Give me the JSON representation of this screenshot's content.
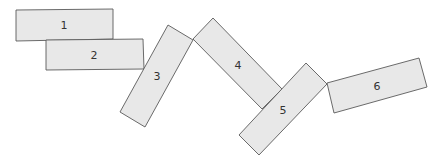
{
  "diagram": {
    "shapes": [
      {
        "id": "1",
        "label": "1",
        "points": "16,10 113,9 113,39 16,41",
        "label_pos": [
          64,
          26
        ]
      },
      {
        "id": "2",
        "label": "2",
        "points": "46,40 143,39 144,69 46,70",
        "label_pos": [
          94,
          56
        ]
      },
      {
        "id": "3",
        "label": "3",
        "points": "168,25 193,40 145,127 120,112",
        "label_pos": [
          157,
          77
        ]
      },
      {
        "id": "4",
        "label": "4",
        "points": "193,39 213,18 282,89 262,109",
        "label_pos": [
          238,
          66
        ]
      },
      {
        "id": "5",
        "label": "5",
        "points": "306,63 327,84 259,155 239,135",
        "label_pos": [
          283,
          111
        ]
      },
      {
        "id": "6",
        "label": "6",
        "points": "327,83 419,58 427,87 334,113",
        "label_pos": [
          377,
          87
        ]
      }
    ],
    "colors": {
      "fill": "#e8e8e8",
      "stroke": "#5a5a5a",
      "text": "#333333"
    }
  }
}
